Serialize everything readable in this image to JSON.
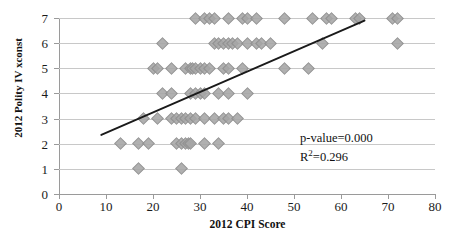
{
  "chart_data": {
    "type": "scatter",
    "title": "",
    "xlabel": "2012 CPI Score",
    "ylabel": "2012 Polity IV xconst",
    "xlim": [
      0,
      80
    ],
    "ylim": [
      0,
      7
    ],
    "xticks": [
      0,
      10,
      20,
      30,
      40,
      50,
      60,
      70,
      80
    ],
    "yticks": [
      0,
      1,
      2,
      3,
      4,
      5,
      6,
      7
    ],
    "grid": "horizontal",
    "legend": "none",
    "marker_color": "#a6a6a6",
    "marker_shape": "diamond",
    "trendline": {
      "color": "#1a1a1a",
      "x_start": 9,
      "y_start": 2.35,
      "x_end": 65,
      "y_end": 6.9
    },
    "annotations": [
      "p-value=0.000",
      "R²=0.296"
    ],
    "p_value": "0.000",
    "r_squared": "0.296",
    "points": [
      {
        "x": 13,
        "y": 2
      },
      {
        "x": 17,
        "y": 1
      },
      {
        "x": 17,
        "y": 2
      },
      {
        "x": 26,
        "y": 1
      },
      {
        "x": 19,
        "y": 2
      },
      {
        "x": 25,
        "y": 2
      },
      {
        "x": 26,
        "y": 2
      },
      {
        "x": 27,
        "y": 2
      },
      {
        "x": 27.5,
        "y": 2
      },
      {
        "x": 28,
        "y": 2
      },
      {
        "x": 31,
        "y": 2
      },
      {
        "x": 34,
        "y": 2
      },
      {
        "x": 18,
        "y": 3
      },
      {
        "x": 21,
        "y": 3
      },
      {
        "x": 24,
        "y": 3
      },
      {
        "x": 25,
        "y": 3
      },
      {
        "x": 26,
        "y": 3
      },
      {
        "x": 27,
        "y": 3
      },
      {
        "x": 28,
        "y": 3
      },
      {
        "x": 29,
        "y": 3
      },
      {
        "x": 31,
        "y": 3
      },
      {
        "x": 33,
        "y": 3
      },
      {
        "x": 35,
        "y": 3
      },
      {
        "x": 36,
        "y": 3
      },
      {
        "x": 38,
        "y": 3
      },
      {
        "x": 22,
        "y": 4
      },
      {
        "x": 24,
        "y": 4
      },
      {
        "x": 28,
        "y": 4
      },
      {
        "x": 29,
        "y": 4
      },
      {
        "x": 30,
        "y": 4
      },
      {
        "x": 31,
        "y": 4
      },
      {
        "x": 34,
        "y": 4
      },
      {
        "x": 36,
        "y": 4
      },
      {
        "x": 40,
        "y": 4
      },
      {
        "x": 20,
        "y": 5
      },
      {
        "x": 21,
        "y": 5
      },
      {
        "x": 24,
        "y": 5
      },
      {
        "x": 27,
        "y": 5
      },
      {
        "x": 28,
        "y": 5
      },
      {
        "x": 28.5,
        "y": 5
      },
      {
        "x": 29,
        "y": 5
      },
      {
        "x": 30,
        "y": 5
      },
      {
        "x": 31,
        "y": 5
      },
      {
        "x": 32,
        "y": 5
      },
      {
        "x": 35,
        "y": 5
      },
      {
        "x": 36,
        "y": 5
      },
      {
        "x": 39,
        "y": 5
      },
      {
        "x": 48,
        "y": 5
      },
      {
        "x": 53,
        "y": 5
      },
      {
        "x": 22,
        "y": 6
      },
      {
        "x": 33,
        "y": 6
      },
      {
        "x": 34,
        "y": 6
      },
      {
        "x": 35,
        "y": 6
      },
      {
        "x": 36,
        "y": 6
      },
      {
        "x": 37,
        "y": 6
      },
      {
        "x": 38,
        "y": 6
      },
      {
        "x": 40,
        "y": 6
      },
      {
        "x": 42,
        "y": 6
      },
      {
        "x": 43,
        "y": 6
      },
      {
        "x": 45,
        "y": 6
      },
      {
        "x": 56,
        "y": 6
      },
      {
        "x": 72,
        "y": 6
      },
      {
        "x": 29,
        "y": 7
      },
      {
        "x": 31,
        "y": 7
      },
      {
        "x": 32,
        "y": 7
      },
      {
        "x": 33,
        "y": 7
      },
      {
        "x": 36,
        "y": 7
      },
      {
        "x": 39,
        "y": 7
      },
      {
        "x": 40,
        "y": 7
      },
      {
        "x": 42,
        "y": 7
      },
      {
        "x": 48,
        "y": 7
      },
      {
        "x": 54,
        "y": 7
      },
      {
        "x": 57,
        "y": 7
      },
      {
        "x": 58,
        "y": 7
      },
      {
        "x": 63,
        "y": 7
      },
      {
        "x": 64,
        "y": 7
      },
      {
        "x": 71,
        "y": 7
      },
      {
        "x": 72,
        "y": 7
      }
    ]
  }
}
